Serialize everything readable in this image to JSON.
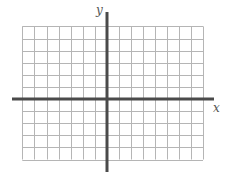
{
  "diagram": {
    "type": "coordinate-plane",
    "axes": {
      "x_label": "x",
      "y_label": "y",
      "color": "#4a4a4a"
    },
    "grid": {
      "color": "#b5b5b5",
      "cell_px": 12.1,
      "left_px": 22,
      "top_px": 26,
      "cols_left_of_y_axis": 7,
      "cols_right_of_y_axis": 8,
      "rows_above_x_axis": 6,
      "rows_below_x_axis": 5
    },
    "origin_px": {
      "x": 107,
      "y": 99
    }
  }
}
